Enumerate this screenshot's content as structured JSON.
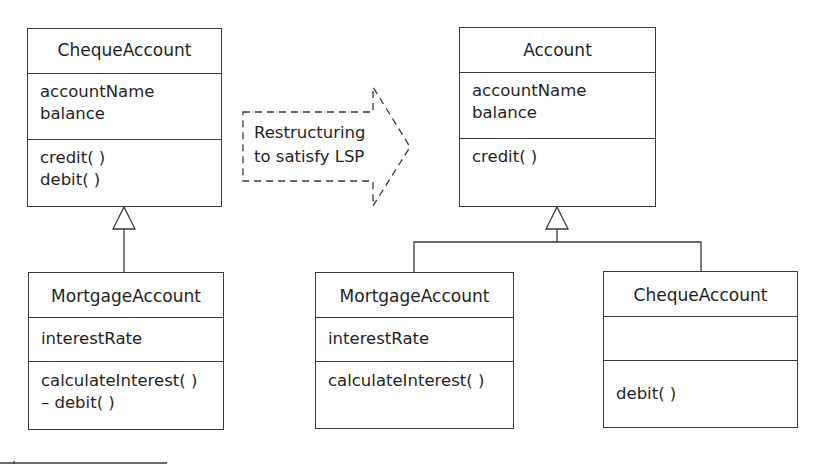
{
  "diagram": {
    "left": {
      "superclass": {
        "name": "ChequeAccount",
        "attributes": [
          "accountName",
          "balance"
        ],
        "operations": [
          "credit( )",
          "debit( )"
        ]
      },
      "subclass": {
        "name": "MortgageAccount",
        "attributes": [
          "interestRate"
        ],
        "operations": [
          "calculateInterest( )",
          "– debit( )"
        ]
      }
    },
    "transition": {
      "label_line1": "Restructuring",
      "label_line2": "to satisfy LSP"
    },
    "right": {
      "superclass": {
        "name": "Account",
        "attributes": [
          "accountName",
          "balance"
        ],
        "operations": [
          "credit( )"
        ]
      },
      "subclasses": [
        {
          "name": "MortgageAccount",
          "attributes": [
            "interestRate"
          ],
          "operations": [
            "calculateInterest( )"
          ]
        },
        {
          "name": "ChequeAccount",
          "attributes": [],
          "operations": [
            "debit( )"
          ]
        }
      ]
    }
  },
  "colors": {
    "line": "#3a3a3a",
    "text": "#1f1f1f",
    "background": "#ffffff"
  }
}
